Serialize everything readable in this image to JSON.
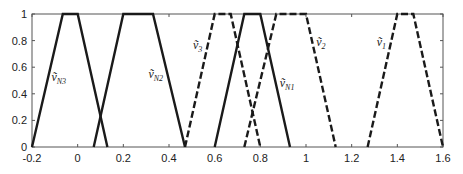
{
  "chart_data": {
    "type": "line",
    "title": "",
    "xlabel": "",
    "ylabel": "",
    "xlim": [
      -0.2,
      1.6
    ],
    "ylim": [
      0,
      1
    ],
    "grid": false,
    "legend": "inline labels",
    "x_ticks": [
      "-0.2",
      "0",
      "0.2",
      "0.4",
      "0.6",
      "0.8",
      "1",
      "1.2",
      "1.4",
      "1.6"
    ],
    "y_ticks": [
      "0",
      "0.2",
      "0.4",
      "0.6",
      "0.8",
      "1"
    ],
    "series": [
      {
        "name": "ṽN3",
        "base": "ṽ",
        "sub": "N3",
        "style": "solid",
        "x": [
          -0.2,
          -0.065,
          0.0,
          0.13
        ],
        "y": [
          0,
          1,
          1,
          0
        ],
        "label_pos": [
          -0.115,
          0.5
        ]
      },
      {
        "name": "ṽN2",
        "base": "ṽ",
        "sub": "N2",
        "style": "solid",
        "x": [
          0.07,
          0.2,
          0.33,
          0.47
        ],
        "y": [
          0,
          1,
          1,
          0
        ],
        "label_pos": [
          0.31,
          0.52
        ]
      },
      {
        "name": "ṽ3",
        "base": "ṽ",
        "sub": "3",
        "style": "dashed",
        "x": [
          0.47,
          0.6,
          0.67,
          0.8
        ],
        "y": [
          0,
          1,
          1,
          0
        ],
        "label_pos": [
          0.505,
          0.74
        ]
      },
      {
        "name": "ṽN1",
        "base": "ṽ",
        "sub": "N1",
        "style": "solid",
        "x": [
          0.6,
          0.73,
          0.8,
          0.93
        ],
        "y": [
          0,
          1,
          1,
          0
        ],
        "label_pos": [
          0.885,
          0.45
        ]
      },
      {
        "name": "ṽ2",
        "base": "ṽ",
        "sub": "2",
        "style": "dashed",
        "x": [
          0.73,
          0.87,
          1.0,
          1.13
        ],
        "y": [
          0,
          1,
          1,
          0
        ],
        "label_pos": [
          1.045,
          0.76
        ]
      },
      {
        "name": "ṽ1",
        "base": "ṽ",
        "sub": "1",
        "style": "dashed",
        "x": [
          1.27,
          1.4,
          1.47,
          1.6
        ],
        "y": [
          0,
          1,
          1,
          0
        ],
        "label_pos": [
          1.31,
          0.76
        ]
      }
    ]
  }
}
